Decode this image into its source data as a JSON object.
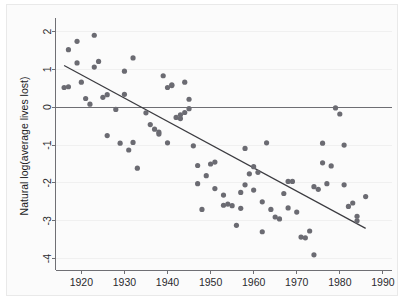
{
  "chart_data": {
    "type": "scatter",
    "title": "",
    "subtitle": "",
    "xlabel": "",
    "ylabel": "Natural log(average lives lost)",
    "xlim": [
      1914,
      1992
    ],
    "ylim": [
      -4.3,
      2.25
    ],
    "xticks": [
      1920,
      1930,
      1940,
      1950,
      1960,
      1970,
      1980,
      1990
    ],
    "yticks": [
      2,
      1,
      0,
      -1,
      -2,
      -3,
      -4
    ],
    "xtick_labels": [
      "1920",
      "1930",
      "1940",
      "1950",
      "1960",
      "1970",
      "1980",
      "1990"
    ],
    "ytick_labels": [
      "2",
      "1",
      "0",
      "-1",
      "-2",
      "-3",
      "-4"
    ],
    "grid": "horizontal",
    "legend": "none",
    "marker_color": "#6b6b72",
    "fit_line_color": "#3b3b40",
    "zero_line_color": "#6e6e73",
    "annotations": [
      {
        "name": "zero-reference-line",
        "y": 0
      }
    ],
    "fit_line": {
      "name": "linear-fit",
      "x": [
        1916,
        1986
      ],
      "y": [
        1.1,
        -3.2
      ]
    },
    "x": [
      1916,
      1917,
      1917,
      1919,
      1919,
      1920,
      1921,
      1922,
      1923,
      1923,
      1924,
      1925,
      1926,
      1926,
      1928,
      1929,
      1930,
      1930,
      1931,
      1932,
      1932,
      1933,
      1935,
      1936,
      1937,
      1938,
      1938,
      1939,
      1940,
      1940,
      1941,
      1941,
      1942,
      1943,
      1943,
      1944,
      1944,
      1945,
      1945,
      1946,
      1947,
      1947,
      1948,
      1949,
      1950,
      1951,
      1951,
      1953,
      1953,
      1954,
      1955,
      1956,
      1957,
      1957,
      1958,
      1958,
      1959,
      1960,
      1960,
      1961,
      1962,
      1962,
      1963,
      1964,
      1965,
      1966,
      1967,
      1968,
      1968,
      1969,
      1970,
      1971,
      1972,
      1973,
      1974,
      1974,
      1975,
      1976,
      1976,
      1977,
      1978,
      1979,
      1980,
      1981,
      1981,
      1982,
      1983,
      1984,
      1984,
      1986
    ],
    "y": [
      0.52,
      1.52,
      0.54,
      1.74,
      1.17,
      0.66,
      0.23,
      0.08,
      1.06,
      1.9,
      1.21,
      0.26,
      0.33,
      -0.75,
      -0.06,
      -0.95,
      0.95,
      0.34,
      -1.13,
      -0.93,
      1.3,
      -1.61,
      -0.15,
      -0.46,
      -0.58,
      -0.66,
      -0.71,
      0.83,
      -0.94,
      0.52,
      0.57,
      0.59,
      -0.27,
      -0.3,
      -0.2,
      0.66,
      -0.14,
      0.21,
      -0.04,
      -1.02,
      -2.02,
      -1.54,
      -2.7,
      -1.81,
      -1.5,
      -1.45,
      -2.15,
      -2.32,
      -2.59,
      -2.56,
      -2.6,
      -3.12,
      -2.67,
      -2.25,
      -1.09,
      -2.05,
      -1.76,
      -1.57,
      -2.19,
      -1.72,
      -2.5,
      -3.29,
      -0.94,
      -2.7,
      -2.9,
      -2.95,
      -2.28,
      -2.66,
      -1.96,
      -1.96,
      -2.77,
      -3.43,
      -3.45,
      -3.27,
      -3.9,
      -2.1,
      -2.17,
      -1.47,
      -0.95,
      -2.02,
      -1.55,
      -0.02,
      -0.18,
      -1.0,
      -2.05,
      -2.62,
      -2.53,
      -2.88,
      -3.0,
      -2.36
    ]
  }
}
